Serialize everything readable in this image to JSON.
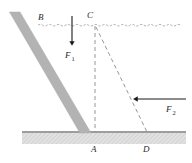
{
  "figure": {
    "background_color": "#ffffff"
  },
  "labels": {
    "point_b": "B",
    "point_c": "C",
    "point_a": "A",
    "point_d": "D",
    "force_1": "F",
    "force_1_sub": "1",
    "force_2": "F",
    "force_2_sub": "2"
  },
  "colors": {
    "beam_fill": "#b3b3b3",
    "beam_stroke": "#a0a0a0",
    "ground_fill": "#dcdcdc",
    "ground_stroke": "#808080",
    "line_stroke": "#8c8c8c",
    "water_stroke": "#9a9a9a",
    "arrow_stroke": "#1a1a1a",
    "text": "#2b2b2b"
  },
  "geometry": {
    "water_line_y": 25,
    "water_line_x_start": 38,
    "water_line_x_end": 187,
    "ground_line_y": 132,
    "ground_x_start": 22,
    "ground_x_end": 186,
    "ground_band_height": 11,
    "beam_top": [
      14,
      12
    ],
    "beam_bottom": [
      85,
      133
    ],
    "beam_width": 11,
    "point_c": [
      95,
      25
    ],
    "point_a": [
      95,
      132
    ],
    "point_d": [
      147,
      132
    ],
    "force_1_arrow": {
      "x": 72,
      "y_start": 16,
      "y_end": 45
    },
    "force_2_arrow": {
      "y": 99,
      "x_start": 133,
      "x_end": 186
    }
  },
  "annotations": {
    "beam_description": "inclined gray ladder/beam",
    "water_description": "wavy dashed water surface line",
    "ground_description": "hatched ground band",
    "dashed_ca": "vertical dashed line from C down to A",
    "dashed_cd": "diagonal dashed line from C down to D"
  }
}
